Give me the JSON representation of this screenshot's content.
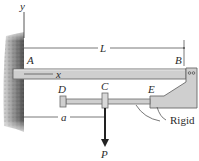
{
  "figure": {
    "type": "structural-mechanics-diagram",
    "labels": {
      "y_axis": "y",
      "x_axis": "x",
      "point_A": "A",
      "point_B": "B",
      "point_C": "C",
      "point_D": "D",
      "point_E": "E",
      "length_L": "L",
      "distance_a": "a",
      "load_P": "P",
      "rigid_note": "Rigid"
    },
    "colors": {
      "beam_fill": "#cfcfcf",
      "beam_stroke": "#6a6a6a",
      "wall_dark": "#5a5a5a",
      "wall_light": "#bdbdbd",
      "arrow": "#222222",
      "dimension_line": "#555555"
    }
  }
}
